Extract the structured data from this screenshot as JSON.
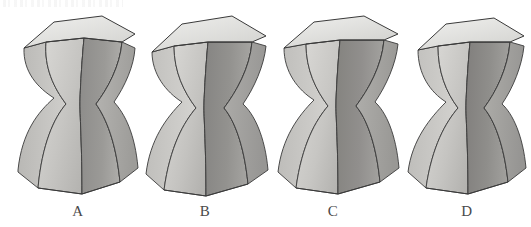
{
  "figure": {
    "background_color": "#ffffff",
    "artifact_note": "faint scan speckle strip at top-left",
    "object_count": 4,
    "object_description": "hexagonal hyperboloid solid with flared base and pinched waist"
  },
  "palette": {
    "top_face": "#e6e6e4",
    "top_face_shadow": "#d2d2cf",
    "left_panel_light": "#cecdca",
    "left_panel_mid": "#bcbbb8",
    "front_panel": "#a9a8a5",
    "right_panel_mid": "#8f8e8c",
    "right_panel_dark": "#787775",
    "outline": "#3a3a3a",
    "ruling_line": "#4d4d4d",
    "caption_color": "#4a4a4a"
  },
  "solids": [
    {
      "id": "solid-a",
      "label": "A",
      "left": 8,
      "caption_left": 48,
      "twist": "slight",
      "waist_y": 96
    },
    {
      "id": "solid-b",
      "label": "B",
      "left": 140,
      "caption_left": 175,
      "twist": "moderate",
      "waist_y": 98
    },
    {
      "id": "solid-c",
      "label": "C",
      "left": 270,
      "caption_left": 303,
      "twist": "moderate",
      "waist_y": 97
    },
    {
      "id": "solid-d",
      "label": "D",
      "left": 398,
      "caption_left": 437,
      "twist": "strong",
      "waist_y": 99
    }
  ]
}
